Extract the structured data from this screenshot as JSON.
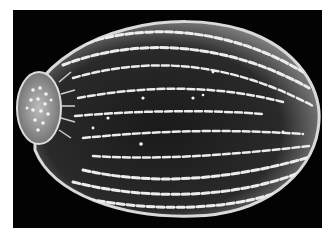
{
  "image": {
    "kind": "SEM micrograph",
    "subject": "ovoid seed with ribbed reticulate testa",
    "background_color": "#030303",
    "border_color": "#ffffff",
    "foreground_tone": "#e8e8e8"
  }
}
